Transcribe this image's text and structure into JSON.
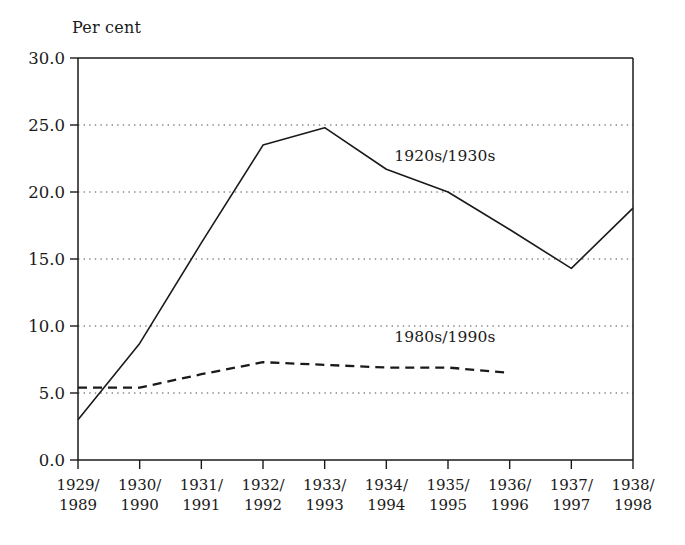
{
  "chart_data": {
    "type": "line",
    "title": "",
    "ylabel": "Per cent",
    "xlabel": "",
    "ylim": [
      0.0,
      30.0
    ],
    "yticks": [
      "0.0",
      "5.0",
      "10.0",
      "15.0",
      "20.0",
      "25.0",
      "30.0"
    ],
    "ytick_values": [
      0.0,
      5.0,
      10.0,
      15.0,
      20.0,
      25.0,
      30.0
    ],
    "grid": "horizontal-dotted",
    "legend_position": "inline-annotation",
    "categories": [
      "1929/\n1989",
      "1930/\n1990",
      "1931/\n1991",
      "1932/\n1992",
      "1933/\n1993",
      "1934/\n1994",
      "1935/\n1995",
      "1936/\n1996",
      "1937/\n1997",
      "1938/\n1998"
    ],
    "categories_top": [
      "1929/",
      "1930/",
      "1931/",
      "1932/",
      "1933/",
      "1934/",
      "1935/",
      "1936/",
      "1937/",
      "1938/"
    ],
    "categories_bottom": [
      "1989",
      "1990",
      "1991",
      "1992",
      "1993",
      "1994",
      "1995",
      "1996",
      "1997",
      "1998"
    ],
    "series": [
      {
        "name": "1920s/1930s",
        "style": "solid",
        "color": "#1a1a1a",
        "values": [
          3.0,
          8.7,
          16.2,
          23.5,
          24.8,
          21.7,
          20.0,
          17.2,
          14.3,
          18.8
        ]
      },
      {
        "name": "1980s/1990s",
        "style": "dashed",
        "color": "#1a1a1a",
        "values": [
          5.4,
          5.4,
          6.4,
          7.3,
          7.1,
          6.9,
          6.9,
          6.5,
          null,
          null
        ]
      }
    ],
    "annotations": [
      {
        "text": "1920s/1930s",
        "x_category": "1934/1994",
        "y": 22.6
      },
      {
        "text": "1980s/1990s",
        "x_category": "1934/1994",
        "y": 9.1
      }
    ]
  },
  "axes": {
    "y_axis_title": "Per cent",
    "y_tick_labels": [
      "30.0",
      "25.0",
      "20.0",
      "15.0",
      "10.0",
      "5.0",
      "0.0"
    ],
    "x_tick_labels": [
      {
        "top": "1929/",
        "bottom": "1989"
      },
      {
        "top": "1930/",
        "bottom": "1990"
      },
      {
        "top": "1931/",
        "bottom": "1991"
      },
      {
        "top": "1932/",
        "bottom": "1992"
      },
      {
        "top": "1933/",
        "bottom": "1993"
      },
      {
        "top": "1934/",
        "bottom": "1994"
      },
      {
        "top": "1935/",
        "bottom": "1995"
      },
      {
        "top": "1936/",
        "bottom": "1996"
      },
      {
        "top": "1937/",
        "bottom": "1997"
      },
      {
        "top": "1938/",
        "bottom": "1998"
      }
    ]
  },
  "colors": {
    "ink": "#1a1a1a",
    "background": "#ffffff",
    "grid": "#4d4d4d"
  }
}
